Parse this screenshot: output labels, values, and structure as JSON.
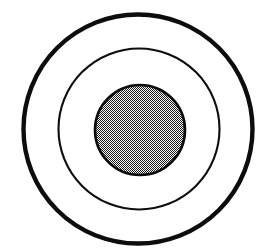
{
  "figure": {
    "canvas": {
      "width": 271,
      "height": 252,
      "background_color": "#ffffff"
    },
    "colors": {
      "stroke": "#0d0d0d",
      "background": "#ffffff",
      "fill_dither_dark": "#1a1a1a",
      "fill_dither_light": "#ffffff",
      "fill_apparent_gray": "#b4b4b4"
    },
    "shapes": [
      {
        "name": "outer-circle",
        "shape": "circle",
        "cx": 138,
        "cy": 129,
        "r": 114.5,
        "diameter": 229,
        "stroke_width": 4.4,
        "stroke_color": "#0d0d0d",
        "fill": "none",
        "fill_label": "white"
      },
      {
        "name": "middle-circle",
        "shape": "circle",
        "cx": 139,
        "cy": 129,
        "r": 80.5,
        "diameter": 161,
        "stroke_width": 2.1,
        "stroke_color": "#0d0d0d",
        "fill": "none",
        "fill_label": "white"
      },
      {
        "name": "inner-circle",
        "shape": "circle",
        "cx": 140,
        "cy": 130,
        "r": 45,
        "diameter": 90,
        "stroke_width": 2.6,
        "stroke_color": "#0d0d0d",
        "fill": "checkerboard-dither",
        "fill_label": "gray halftone"
      }
    ],
    "annulus_bands": [
      {
        "name": "outer-band",
        "inner_diameter": 161,
        "outer_diameter": 229,
        "fill_label": "white"
      },
      {
        "name": "middle-band",
        "inner_diameter": 90,
        "outer_diameter": 161,
        "fill_label": "white"
      },
      {
        "name": "core",
        "inner_diameter": 0,
        "outer_diameter": 90,
        "fill_label": "gray halftone"
      }
    ]
  }
}
